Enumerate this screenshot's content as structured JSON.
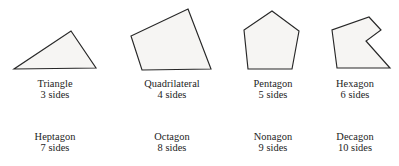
{
  "figure": {
    "background_color": "#ffffff",
    "shape_fill_color": "#f6f5f3",
    "shape_stroke_color": "#272727",
    "text_color": "#232323"
  },
  "polygons": [
    {
      "id": "triangle",
      "name": "Triangle",
      "sides_label": "3 sides",
      "sides": 3,
      "points": "14,69 96,68 71,31",
      "has_drawing": true
    },
    {
      "id": "quadrilateral",
      "name": "Quadrilateral",
      "sides_label": "4 sides",
      "sides": 4,
      "points": "188,9 211,69 142,70 131,36",
      "has_drawing": true
    },
    {
      "id": "pentagon",
      "name": "Pentagon",
      "sides_label": "5 sides",
      "sides": 5,
      "points": "272,11 299,31 292,69 248,69 244,30",
      "has_drawing": true
    },
    {
      "id": "hexagon",
      "name": "Hexagon",
      "sides_label": "6 sides",
      "sides": 6,
      "points": "369,17 381,30 366,41 390,68 337,68 332,30",
      "has_drawing": true
    },
    {
      "id": "heptagon",
      "name": "Heptagon",
      "sides_label": "7 sides",
      "sides": 7,
      "points": "",
      "has_drawing": false
    },
    {
      "id": "octagon",
      "name": "Octagon",
      "sides_label": "8 sides",
      "sides": 8,
      "points": "",
      "has_drawing": false
    },
    {
      "id": "nonagon",
      "name": "Nonagon",
      "sides_label": "9 sides",
      "sides": 9,
      "points": "",
      "has_drawing": false
    },
    {
      "id": "decagon",
      "name": "Decagon",
      "sides_label": "10 sides",
      "sides": 10,
      "points": "",
      "has_drawing": false
    }
  ]
}
